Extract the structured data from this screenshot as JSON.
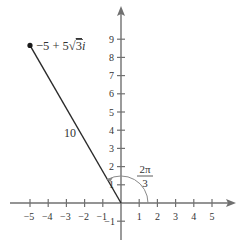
{
  "diagram": {
    "type": "complex-plane",
    "x_axis": {
      "ticks": [
        -5,
        -4,
        -3,
        -2,
        -1,
        1,
        2,
        3,
        4,
        5
      ],
      "labels": [
        "−5",
        "−4",
        "−3",
        "−2",
        "−1",
        "1",
        "2",
        "3",
        "4",
        "5"
      ]
    },
    "y_axis": {
      "ticks": [
        -1,
        1,
        2,
        3,
        4,
        5,
        6,
        7,
        8,
        9
      ],
      "labels": [
        "−1",
        "1",
        "2",
        "3",
        "4",
        "5",
        "6",
        "7",
        "8",
        "9"
      ]
    },
    "point": {
      "re": -5,
      "im": 8.66,
      "label_a": "−5 + 5",
      "label_sqrt": "√",
      "label_b": "3",
      "label_i": "i"
    },
    "modulus_label": "10",
    "angle_label": {
      "numerator": "2π",
      "denominator": "3"
    },
    "colors": {
      "axis": "#707070",
      "segment": "#2a2a2a",
      "arc": "#8a8a8a",
      "text": "#333333"
    }
  }
}
